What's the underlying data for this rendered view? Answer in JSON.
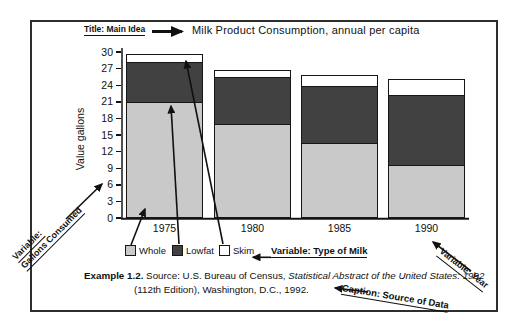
{
  "figure": {
    "pointer_labels": {
      "title": "Title: Main Idea",
      "gallons_line1": "Variable:",
      "gallons_line2": "Gallons Consumed",
      "type_of_milk": "Variable: Type of Milk",
      "year": "Variable: Year",
      "caption": "Caption: Source of Data"
    },
    "caption": {
      "example": "Example 1.2.",
      "pre_italic": " Source: U.S. Bureau of Census, ",
      "italic": "Statistical Abstract of the United States: 1992",
      "line2": "(112th Edition), Washington, D.C., 1992."
    }
  },
  "chart_data": {
    "type": "bar",
    "stacked": true,
    "title": "Milk Product Consumption, annual per capita",
    "ylabel": "Value gallons",
    "xlabel": "",
    "ylim": [
      0,
      30
    ],
    "ytick_step": 3,
    "grid": false,
    "legend_position": "bottom",
    "categories": [
      "1975",
      "1980",
      "1985",
      "1990"
    ],
    "series": [
      {
        "name": "Whole",
        "color": "#c9c9c9",
        "values": [
          21.0,
          17.0,
          13.5,
          9.5
        ]
      },
      {
        "name": "Lowfat",
        "color": "#414141",
        "values": [
          7.4,
          8.7,
          10.6,
          12.9
        ]
      },
      {
        "name": "Skim",
        "color": "#ffffff",
        "values": [
          1.3,
          1.1,
          1.8,
          2.8
        ]
      }
    ],
    "totals": [
      29.7,
      26.8,
      25.9,
      25.2
    ]
  },
  "legend": {
    "items": [
      {
        "label": "Whole",
        "color": "#c9c9c9"
      },
      {
        "label": "Lowfat",
        "color": "#414141"
      },
      {
        "label": "Skim",
        "color": "#ffffff"
      }
    ]
  }
}
